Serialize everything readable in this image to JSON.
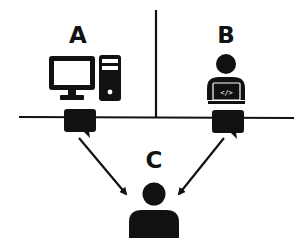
{
  "diagram": {
    "colors": {
      "ink": "#111111",
      "background": "#ffffff"
    },
    "nodes": [
      {
        "id": "A",
        "label": "A",
        "icon": "desktop-computer-icon",
        "description": "Desktop computer with monitor and tower"
      },
      {
        "id": "B",
        "label": "B",
        "icon": "developer-laptop-icon",
        "description": "Person at laptop showing code symbol",
        "screen_text": "</>"
      },
      {
        "id": "C",
        "label": "C",
        "icon": "person-icon",
        "description": "Person receiving messages"
      }
    ],
    "connectors": [
      {
        "from": "A",
        "to": "C",
        "type": "arrow",
        "via": "speech-bubble"
      },
      {
        "from": "B",
        "to": "C",
        "type": "arrow",
        "via": "speech-bubble"
      }
    ],
    "dividers": [
      {
        "orientation": "horizontal"
      },
      {
        "orientation": "vertical"
      }
    ]
  }
}
